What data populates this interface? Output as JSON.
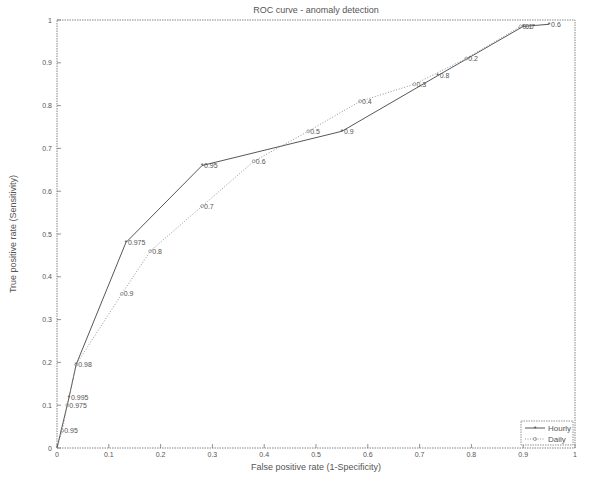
{
  "chart_data": {
    "type": "line",
    "title": "ROC curve - anomaly detection",
    "xlabel": "False positive rate (1-Specificity)",
    "ylabel": "True positive rate (Sensitivity)",
    "xlim": [
      0,
      1
    ],
    "ylim": [
      0,
      1
    ],
    "xticks": [
      "0",
      "0.1",
      "0.2",
      "0.3",
      "0.4",
      "0.5",
      "0.6",
      "0.7",
      "0.8",
      "0.9",
      "1"
    ],
    "yticks": [
      "0",
      "0.1",
      "0.2",
      "0.3",
      "0.4",
      "0.5",
      "0.6",
      "0.7",
      "0.8",
      "0.9",
      "1"
    ],
    "grid": false,
    "legend_position": "lower right",
    "series": [
      {
        "name": "Hourly",
        "style": "solid",
        "marker": "star",
        "color": "#444444",
        "points": [
          {
            "x": 0.0,
            "y": 0.0,
            "label": ""
          },
          {
            "x": 0.023,
            "y": 0.117,
            "label": "0.995"
          },
          {
            "x": 0.037,
            "y": 0.195,
            "label": "0.98"
          },
          {
            "x": 0.133,
            "y": 0.48,
            "label": "0.975"
          },
          {
            "x": 0.28,
            "y": 0.66,
            "label": "0.95"
          },
          {
            "x": 0.55,
            "y": 0.74,
            "label": "0.9"
          },
          {
            "x": 0.735,
            "y": 0.87,
            "label": "0.8"
          },
          {
            "x": 0.9,
            "y": 0.985,
            "label": "0.7"
          },
          {
            "x": 0.95,
            "y": 0.99,
            "label": "0.6"
          }
        ]
      },
      {
        "name": "Daily",
        "style": "dotted",
        "marker": "circle",
        "color": "#888888",
        "points": [
          {
            "x": 0.0,
            "y": 0.0,
            "label": ""
          },
          {
            "x": 0.01,
            "y": 0.04,
            "label": "0.95"
          },
          {
            "x": 0.02,
            "y": 0.1,
            "label": "0.975"
          },
          {
            "x": 0.037,
            "y": 0.195,
            "label": ""
          },
          {
            "x": 0.125,
            "y": 0.36,
            "label": "0.9"
          },
          {
            "x": 0.18,
            "y": 0.46,
            "label": "0.8"
          },
          {
            "x": 0.28,
            "y": 0.565,
            "label": "0.7"
          },
          {
            "x": 0.38,
            "y": 0.67,
            "label": "0.6"
          },
          {
            "x": 0.485,
            "y": 0.74,
            "label": "0.5"
          },
          {
            "x": 0.585,
            "y": 0.81,
            "label": "0.4"
          },
          {
            "x": 0.69,
            "y": 0.85,
            "label": "0.3"
          },
          {
            "x": 0.79,
            "y": 0.91,
            "label": "0.2"
          },
          {
            "x": 0.895,
            "y": 0.985,
            "label": "0.1"
          }
        ]
      }
    ]
  },
  "layout": {
    "plot": {
      "left": 57,
      "top": 20,
      "width": 518,
      "height": 428
    }
  }
}
